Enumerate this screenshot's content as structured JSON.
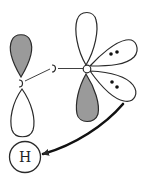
{
  "diagram": {
    "type": "orbital-interaction",
    "colors": {
      "stroke": "#2a2a2a",
      "shaded_lobe": "#9a9a9a",
      "background": "#ffffff"
    },
    "atoms": [
      {
        "id": "c-left",
        "label": "",
        "x": 21,
        "y": 83
      },
      {
        "id": "c-mid",
        "label": "",
        "x": 54,
        "y": 68
      },
      {
        "id": "o",
        "label": "",
        "x": 87,
        "y": 69
      },
      {
        "id": "h",
        "label": "H",
        "x": 25,
        "y": 157
      }
    ],
    "bonds": [
      {
        "from": "c-left",
        "to": "c-mid"
      },
      {
        "from": "c-mid",
        "to": "o"
      }
    ],
    "lobes": [
      {
        "id": "c-left-upper",
        "shaded": true
      },
      {
        "id": "c-left-lower",
        "shaded": false
      },
      {
        "id": "o-upper",
        "shaded": false
      },
      {
        "id": "o-lower",
        "shaded": true
      },
      {
        "id": "o-lone-pair-1",
        "shaded": false,
        "electrons": 2
      },
      {
        "id": "o-lone-pair-2",
        "shaded": false,
        "electrons": 2
      }
    ],
    "arrow": {
      "from": "o-lone-pair-2",
      "to": "h",
      "meaning": "electron donation"
    },
    "h_label": "H"
  }
}
